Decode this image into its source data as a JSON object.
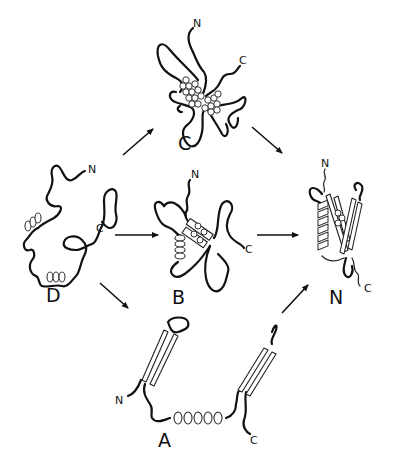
{
  "diagram": {
    "states": {
      "D": {
        "label": "D",
        "n_term": "N",
        "c_term": "C"
      },
      "C": {
        "label": "C",
        "n_term": "N",
        "c_term": "C"
      },
      "B": {
        "label": "B",
        "n_term": "N",
        "c_term": "C"
      },
      "N": {
        "label": "N",
        "n_term": "N",
        "c_term": "C"
      },
      "A": {
        "label": "A",
        "n_term": "N",
        "c_term": "C"
      }
    },
    "transitions": [
      {
        "from": "D",
        "to": "C"
      },
      {
        "from": "C",
        "to": "N"
      },
      {
        "from": "D",
        "to": "B"
      },
      {
        "from": "B",
        "to": "N"
      },
      {
        "from": "D",
        "to": "A"
      },
      {
        "from": "A",
        "to": "N"
      }
    ],
    "colors": {
      "line": "#111111",
      "background": "#ffffff"
    }
  }
}
